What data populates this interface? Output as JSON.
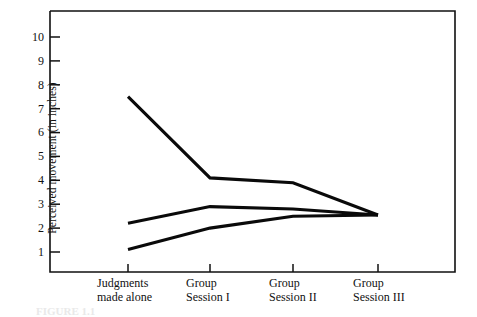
{
  "figure": {
    "caption_partial": "FIGURE 1.1"
  },
  "chart_data": {
    "type": "line",
    "title": "",
    "xlabel": "",
    "ylabel": "Perceived movement (in inches)",
    "categories": [
      "Judgments made alone",
      "Group Session I",
      "Group Session II",
      "Group Session III"
    ],
    "category_lines": [
      [
        "Judgments",
        "made alone"
      ],
      [
        "Group",
        "Session I"
      ],
      [
        "Group",
        "Session II"
      ],
      [
        "Group",
        "Session III"
      ]
    ],
    "yticks": [
      10,
      9,
      8,
      7,
      6,
      5,
      4,
      3,
      2,
      1
    ],
    "ylim": [
      0.55,
      10.6
    ],
    "grid": false,
    "legend": "none",
    "series": [
      {
        "name": "Subject 1 (high initial estimate)",
        "values": [
          7.5,
          4.1,
          3.9,
          2.55
        ]
      },
      {
        "name": "Subject 2 (middle initial estimate)",
        "values": [
          2.2,
          2.9,
          2.8,
          2.55
        ]
      },
      {
        "name": "Subject 3 (low initial estimate)",
        "values": [
          1.1,
          2.0,
          2.5,
          2.55
        ]
      }
    ]
  }
}
